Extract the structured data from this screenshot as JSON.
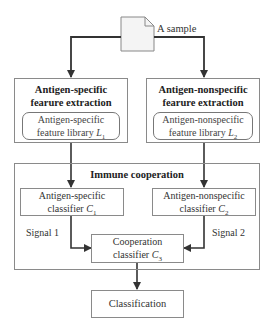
{
  "sample_label": "A sample",
  "left_branch": {
    "title_line1": "Antigen-specific",
    "title_line2": "fearure extraction",
    "library_line1": "Antigen-specific",
    "library_line2": "feature library ",
    "library_symbol": "L",
    "library_sub": "1"
  },
  "right_branch": {
    "title_line1": "Antigen-nonspecific",
    "title_line2": "fearure extraction",
    "library_line1": "Antigen-nonspecific",
    "library_line2": "feature library ",
    "library_symbol": "L",
    "library_sub": "2"
  },
  "cooperation": {
    "title": "Immune cooperation",
    "classifier1_line1": "Antigen-specific",
    "classifier1_line2": "classifier ",
    "classifier1_symbol": "C",
    "classifier1_sub": "1",
    "classifier2_line1": "Antigen-nonspecific",
    "classifier2_line2": "classifier ",
    "classifier2_symbol": "C",
    "classifier2_sub": "2",
    "classifier3_line1": "Cooperation",
    "classifier3_line2": "classifier ",
    "classifier3_symbol": "C",
    "classifier3_sub": "3",
    "signal1": "Signal 1",
    "signal2": "Signal 2"
  },
  "output": {
    "label": "Classification"
  }
}
